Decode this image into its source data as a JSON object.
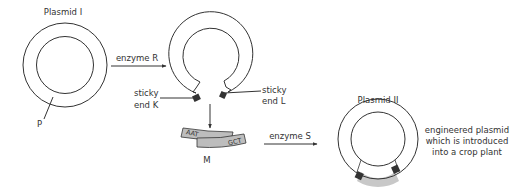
{
  "diagram": {
    "plasmid1": {
      "label": "Plasmid I",
      "marker": "P"
    },
    "step1": {
      "enzyme": "enzyme R"
    },
    "open_plasmid": {
      "sticky_end_k": [
        "sticky",
        "end K"
      ],
      "sticky_end_l": [
        "sticky",
        "end L"
      ]
    },
    "fragment": {
      "label": "M",
      "seq_left": "AAT",
      "seq_right": "GCT"
    },
    "step2": {
      "enzyme": "enzyme S"
    },
    "plasmid2": {
      "label": "Plasmid II",
      "description": [
        "engineered plasmid",
        "which is introduced",
        "into a crop plant"
      ]
    },
    "colors": {
      "line": "#333333",
      "fragment_fill": "#bdbdbd",
      "sticky_fill": "#333333",
      "insert_fill": "#c8c8c8"
    }
  }
}
